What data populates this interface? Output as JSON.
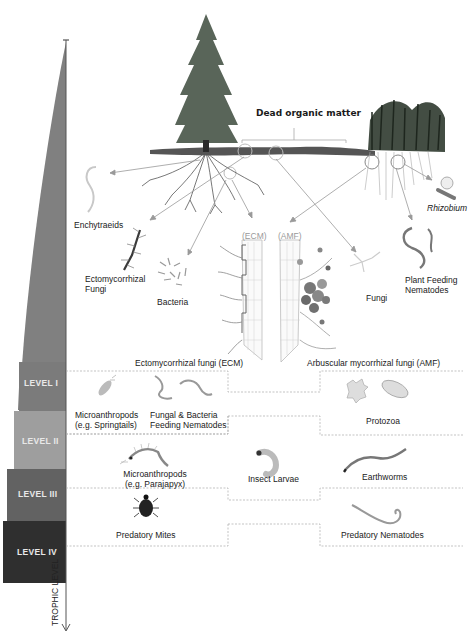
{
  "top_label": "Dead organic matter",
  "axis": {
    "label": "TROPHIC LEVEL",
    "levels": [
      {
        "label": "LEVEL I",
        "color": "#7b7b7b"
      },
      {
        "label": "LEVEL II",
        "color": "#9e9e9e"
      },
      {
        "label": "LEVEL III",
        "color": "#626262"
      },
      {
        "label": "LEVEL IV",
        "color": "#2f2f2f"
      }
    ],
    "wedge_color": "#808080"
  },
  "level1": {
    "organisms": [
      {
        "label": "Enchytraeids"
      },
      {
        "label": "Ectomycorrhizal\nFungi",
        "line1": "Ectomycorrhizal",
        "line2": "Fungi"
      },
      {
        "label": "Bacteria"
      },
      {
        "label": "Fungi"
      },
      {
        "label": "Plant Feeding Nematodes",
        "line1": "Plant Feeding",
        "line2": "Nematodes"
      },
      {
        "label": "Rhizobium"
      }
    ],
    "root_tags": {
      "ecm": "(ECM)",
      "amf": "(AMF)"
    },
    "ecm_caption": "Ectomycorrhizal fungi (ECM)",
    "amf_caption": "Arbuscular mycorrhizal fungi (AMF)"
  },
  "level2": {
    "organisms": [
      {
        "line1": "Microanthropods",
        "line2": "(e.g. Springtails)"
      },
      {
        "line1": "Fungal & Bacteria",
        "line2": "Feeding Nematodes"
      },
      {
        "line1": "Protozoa"
      }
    ]
  },
  "level3": {
    "organisms": [
      {
        "line1": "Microanthropods",
        "line2": "(e.g. Parajapyx)"
      },
      {
        "line1": "Insect Larvae"
      },
      {
        "line1": "Earthworms"
      }
    ]
  },
  "level4": {
    "organisms": [
      {
        "line1": "Predatory Mites"
      },
      {
        "line1": "Predatory Nematodes"
      }
    ]
  }
}
